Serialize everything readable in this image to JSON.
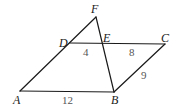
{
  "diagram": {
    "type": "geometry",
    "colors": {
      "line": "#1a1a1a",
      "point_label": "#1a1a1a",
      "length_label": "#555555",
      "background": "#ffffff"
    },
    "points": {
      "A": {
        "label": "A",
        "x": 20,
        "y": 91
      },
      "B": {
        "label": "B",
        "x": 114,
        "y": 92
      },
      "C": {
        "label": "C",
        "x": 165,
        "y": 44
      },
      "D": {
        "label": "D",
        "x": 70,
        "y": 43
      },
      "E": {
        "label": "E",
        "x": 101,
        "y": 43
      },
      "F": {
        "label": "F",
        "x": 96,
        "y": 17
      }
    },
    "segments": [
      {
        "from": "A",
        "to": "B"
      },
      {
        "from": "B",
        "to": "C"
      },
      {
        "from": "D",
        "to": "C"
      },
      {
        "from": "A",
        "to": "F"
      },
      {
        "from": "F",
        "to": "B"
      }
    ],
    "lengths": {
      "DE": "4",
      "EC": "8",
      "BC": "9",
      "AB": "12"
    }
  }
}
